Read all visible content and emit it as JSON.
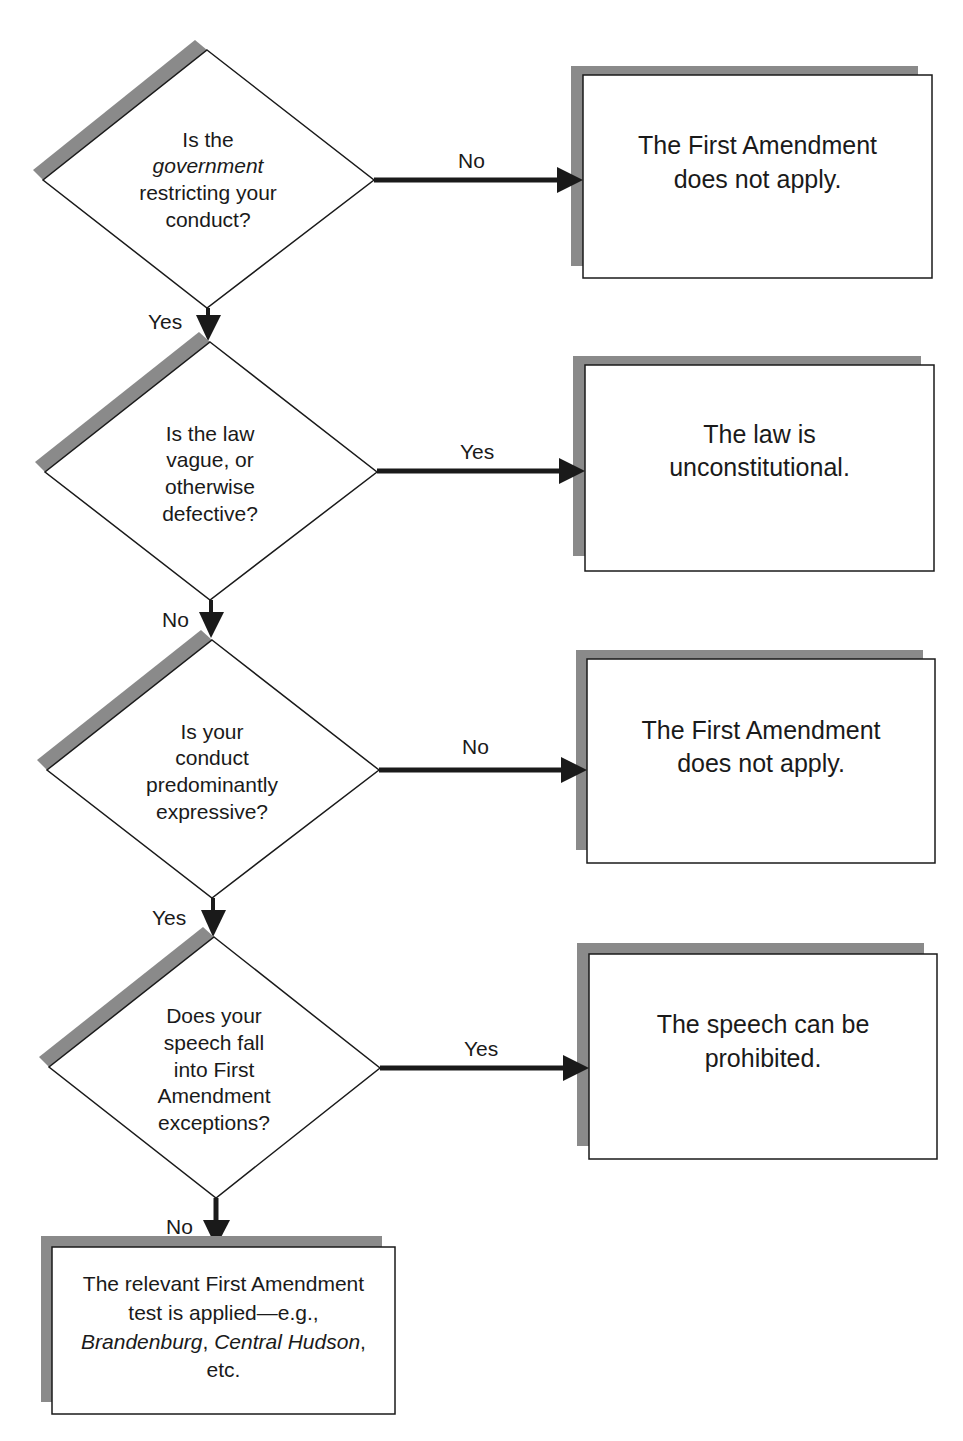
{
  "colors": {
    "stroke": "#1a1a1a",
    "shadow": "#8a8a8a",
    "fill": "#ffffff",
    "background": "#ffffff"
  },
  "decisions": [
    {
      "id": "government-restricting",
      "lines": [
        "Is the",
        "government",
        "restricting your",
        "conduct?"
      ],
      "italic_line_index": 1,
      "right_branch_label": "No",
      "down_branch_label": "Yes"
    },
    {
      "id": "law-vague",
      "lines": [
        "Is the law",
        "vague, or",
        "otherwise",
        "defective?"
      ],
      "right_branch_label": "Yes",
      "down_branch_label": "No"
    },
    {
      "id": "conduct-expressive",
      "lines": [
        "Is your",
        "conduct",
        "predominantly",
        "expressive?"
      ],
      "right_branch_label": "No",
      "down_branch_label": "Yes"
    },
    {
      "id": "speech-exceptions",
      "lines": [
        "Does your",
        "speech fall",
        "into First",
        "Amendment",
        "exceptions?"
      ],
      "right_branch_label": "Yes",
      "down_branch_label": "No"
    }
  ],
  "outcomes": [
    {
      "id": "fa-not-apply-1",
      "lines": [
        "The First Amendment",
        "does not apply."
      ]
    },
    {
      "id": "law-unconstitutional",
      "lines": [
        "The law is",
        "unconstitutional."
      ]
    },
    {
      "id": "fa-not-apply-2",
      "lines": [
        "The First Amendment",
        "does not apply."
      ]
    },
    {
      "id": "speech-prohibited",
      "lines": [
        "The speech can be",
        "prohibited."
      ]
    }
  ],
  "final_outcome": {
    "line1": "The relevant First Amendment",
    "line2": "test is applied—e.g.,",
    "line3_italic_a": "Brandenburg",
    "line3_sep": ", ",
    "line3_italic_b": "Central Hudson",
    "line3_end": ",",
    "line4": "etc."
  }
}
